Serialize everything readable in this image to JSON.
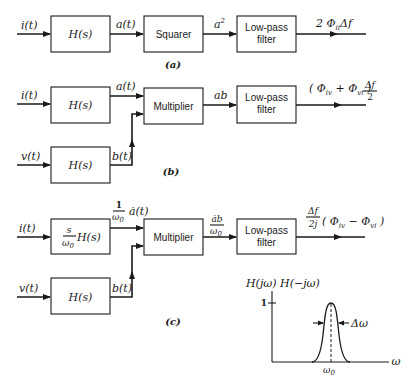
{
  "figure": {
    "panel_a": {
      "caption": "(a)",
      "input_label": "i(t)",
      "block1": "H(s)",
      "signal1": "a(t)",
      "block2": "Squarer",
      "signal2": "a",
      "signal2_sup": "2",
      "block3_line1": "Low-pass",
      "block3_line2": "filter",
      "output_prefix": "2 Φ",
      "output_sub": "ii",
      "output_suffix": "Δf"
    },
    "panel_b": {
      "caption": "(b)",
      "input1_label": "i(t)",
      "input2_label": "v(t)",
      "block_top": "H(s)",
      "block_bottom": "H(s)",
      "signal_top": "a(t)",
      "signal_bottom": "b(t)",
      "multiplier": "Multiplier",
      "product": "ab",
      "lpf_line1": "Low-pass",
      "lpf_line2": "filter",
      "output_open": "( Φ",
      "output_sub1": "iv",
      "output_plus": " + Φ",
      "output_sub2": "vi",
      "output_close": " )",
      "output_frac_num": "Δf",
      "output_frac_den": "2"
    },
    "panel_c": {
      "caption": "(c)",
      "input1_label": "i(t)",
      "input2_label": "v(t)",
      "block_top_num": "s",
      "block_top_den": "ω",
      "block_top_den_sub": "0",
      "block_top_tail": "H(s)",
      "block_bottom": "H(s)",
      "signal_top_num": "1",
      "signal_top_den": "ω",
      "signal_top_den_sub": "0",
      "signal_top_tail": "ȧ(t)",
      "signal_bottom": "b(t)",
      "multiplier": "Multiplier",
      "product_num": "ȧb",
      "product_den": "ω",
      "product_den_sub": "0",
      "lpf_line1": "Low-pass",
      "lpf_line2": "filter",
      "output_frac_num": "Δf",
      "output_frac_den": "2j",
      "output_open": "( Φ",
      "output_sub1": "iv",
      "output_minus": " − Φ",
      "output_sub2": "vi",
      "output_close": " )"
    },
    "response_plot": {
      "ylabel": "H(jω) H(−jω)",
      "ytick": "1",
      "xlabel": "ω",
      "center_label": "ω",
      "center_sub": "0",
      "bandwidth_label": "Δω"
    }
  }
}
